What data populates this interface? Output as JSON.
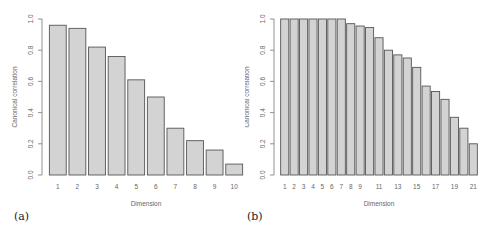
{
  "figure": {
    "panels": [
      {
        "label": "(a)"
      },
      {
        "label": "(b)"
      }
    ]
  },
  "chart_data": [
    {
      "type": "bar",
      "panel": "(a)",
      "title": "",
      "xlabel": "Dimension",
      "ylabel": "Canonical correlation",
      "categories": [
        "1",
        "2",
        "3",
        "4",
        "5",
        "6",
        "7",
        "8",
        "9",
        "10"
      ],
      "x_tick_labels": [
        "1",
        "2",
        "3",
        "4",
        "5",
        "6",
        "7",
        "8",
        "9",
        "10"
      ],
      "values": [
        0.96,
        0.94,
        0.82,
        0.76,
        0.61,
        0.5,
        0.3,
        0.22,
        0.16,
        0.07
      ],
      "ylim": [
        0,
        1.0
      ],
      "y_ticks": [
        "0.0",
        "0.2",
        "0.4",
        "0.6",
        "0.8",
        "1.0"
      ],
      "grid": false,
      "bar_color": "#d3d3d3",
      "edge_color": "#555555"
    },
    {
      "type": "bar",
      "panel": "(b)",
      "title": "",
      "xlabel": "Dimension",
      "ylabel": "Canonical correlation",
      "categories": [
        "1",
        "2",
        "3",
        "4",
        "5",
        "6",
        "7",
        "8",
        "9",
        "10",
        "11",
        "12",
        "13",
        "14",
        "15",
        "16",
        "17",
        "18",
        "19",
        "20",
        "21"
      ],
      "x_tick_labels": [
        "1",
        "2",
        "3",
        "4",
        "5",
        "6",
        "7",
        "8",
        "9",
        "",
        "11",
        "",
        "13",
        "",
        "15",
        "",
        "17",
        "",
        "19",
        "",
        "21"
      ],
      "values": [
        1.0,
        1.0,
        1.0,
        1.0,
        1.0,
        1.0,
        1.0,
        0.97,
        0.955,
        0.945,
        0.88,
        0.8,
        0.77,
        0.75,
        0.69,
        0.57,
        0.535,
        0.485,
        0.37,
        0.3,
        0.2
      ],
      "ylim": [
        0,
        1.0
      ],
      "y_ticks": [
        "0.0",
        "0.2",
        "0.4",
        "0.6",
        "0.8",
        "1.0"
      ],
      "grid": false,
      "bar_color": "#d3d3d3",
      "edge_color": "#555555"
    }
  ]
}
